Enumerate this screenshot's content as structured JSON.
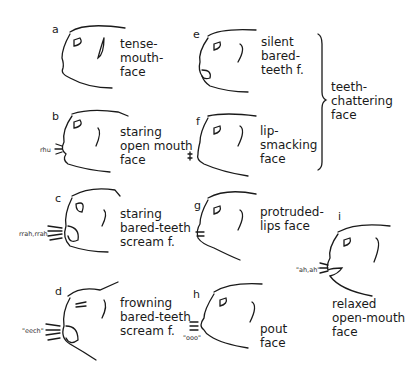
{
  "figure": {
    "panels": [
      {
        "letter": "a",
        "label": "tense-\nmouth-\nface",
        "sound": ""
      },
      {
        "letter": "b",
        "label": "staring\nopen mouth\nface",
        "sound": "rhu"
      },
      {
        "letter": "c",
        "label": "staring\nbared-teeth\nscream f.",
        "sound": "rrah,rrah"
      },
      {
        "letter": "d",
        "label": "frowning\nbared-teeth\nscream f.",
        "sound": "\"eech\""
      },
      {
        "letter": "e",
        "label": "silent\nbared-\nteeth f.",
        "sound": ""
      },
      {
        "letter": "f",
        "label": "lip-\nsmacking\nface",
        "sound": ""
      },
      {
        "letter": "g",
        "label": "protruded-\nlips face",
        "sound": ""
      },
      {
        "letter": "h",
        "label": "pout\nface",
        "sound": "\"ooo\""
      },
      {
        "letter": "i",
        "label": "relaxed\nopen-mouth\nface",
        "sound": "\"ah,ah\""
      }
    ],
    "group_bracket_label": "teeth-\nchattering\nface"
  }
}
